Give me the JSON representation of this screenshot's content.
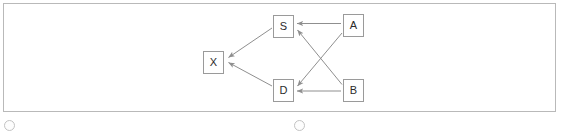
{
  "panel": {
    "border_color": "#b9b9b9",
    "background": "#ffffff"
  },
  "graph": {
    "type": "directed-graph",
    "node_fill": "#ffffff",
    "node_border_color": "#9a9a9a",
    "edge_color": "#8f8f8f",
    "label_color": "#2b2b2b",
    "nodes": [
      {
        "id": "S",
        "label": "S",
        "x": 272,
        "y": 14
      },
      {
        "id": "A",
        "label": "A",
        "x": 342,
        "y": 13
      },
      {
        "id": "X",
        "label": "X",
        "x": 202,
        "y": 50
      },
      {
        "id": "D",
        "label": "D",
        "x": 272,
        "y": 78
      },
      {
        "id": "B",
        "label": "B",
        "x": 342,
        "y": 78
      }
    ],
    "edges": [
      {
        "from": "A",
        "to": "S",
        "directed": true
      },
      {
        "from": "B",
        "to": "S",
        "directed": true
      },
      {
        "from": "A",
        "to": "D",
        "directed": true
      },
      {
        "from": "B",
        "to": "D",
        "directed": true
      },
      {
        "from": "S",
        "to": "X",
        "directed": true
      },
      {
        "from": "D",
        "to": "X",
        "directed": true
      }
    ]
  },
  "bottom_controls": {
    "items": [
      {
        "name": "radio-option-left",
        "label": "",
        "selected": false,
        "x": 4
      },
      {
        "name": "radio-option-right",
        "label": "",
        "selected": false,
        "x": 294
      }
    ]
  }
}
